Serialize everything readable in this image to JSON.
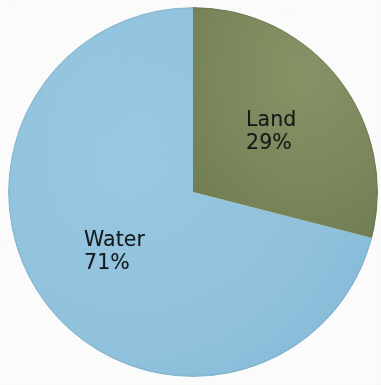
{
  "chart_data": {
    "type": "pie",
    "title": "",
    "subtitle": "",
    "xlabel": "",
    "ylabel": "",
    "legend_position": "none",
    "grid": false,
    "labels_inside_slices": true,
    "total": 100,
    "units": "%",
    "categories": [
      "Land",
      "Water"
    ],
    "values": [
      29,
      71
    ],
    "slices": [
      {
        "name": "Land",
        "label": "Land",
        "value": 29,
        "value_label": "29%",
        "color": "#7d8a5d",
        "start_angle_deg": 0,
        "sweep_deg": 104.4
      },
      {
        "name": "Water",
        "label": "Water",
        "value": 71,
        "value_label": "71%",
        "color": "#92c5e0",
        "start_angle_deg": 104.4,
        "sweep_deg": 255.6
      }
    ],
    "geometry": {
      "center_x": 193,
      "center_y": 192,
      "radius": 185,
      "start_at_twelve_oclock": true,
      "direction": "clockwise"
    },
    "colors": {
      "land": "#7d8a5d",
      "land_shade": "#717e52",
      "water": "#92c5e0",
      "water_shade": "#86bcd9",
      "label_text": "#15191c",
      "background": "#ffffff"
    }
  }
}
